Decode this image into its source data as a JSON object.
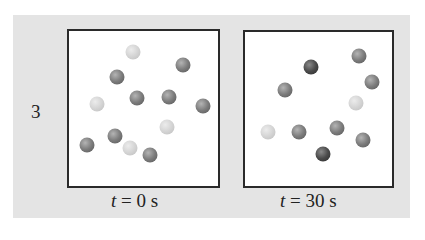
{
  "row": {
    "label": "3"
  },
  "colors": {
    "panel_bg": "#e4e4e4",
    "box_bg": "#ffffff",
    "box_border": "#2a2a2a",
    "ball_light": "#d2d2d2",
    "ball_medium": "#7c7c7c",
    "ball_dark": "#4a4a4a"
  },
  "frames": [
    {
      "variable": "t",
      "equals": " = 0 s",
      "balls": [
        {
          "type": "light",
          "x": 64,
          "y": 21
        },
        {
          "type": "medium",
          "x": 114,
          "y": 34
        },
        {
          "type": "medium",
          "x": 48,
          "y": 46
        },
        {
          "type": "medium",
          "x": 68,
          "y": 67
        },
        {
          "type": "medium",
          "x": 100,
          "y": 66
        },
        {
          "type": "medium",
          "x": 134,
          "y": 75
        },
        {
          "type": "light",
          "x": 28,
          "y": 73
        },
        {
          "type": "light",
          "x": 98,
          "y": 96
        },
        {
          "type": "medium",
          "x": 46,
          "y": 105
        },
        {
          "type": "medium",
          "x": 18,
          "y": 114
        },
        {
          "type": "light",
          "x": 61,
          "y": 117
        },
        {
          "type": "medium",
          "x": 81,
          "y": 124
        }
      ]
    },
    {
      "variable": "t",
      "equals": " = 30 s",
      "balls": [
        {
          "type": "medium",
          "x": 114,
          "y": 24
        },
        {
          "type": "dark",
          "x": 66,
          "y": 35
        },
        {
          "type": "medium",
          "x": 127,
          "y": 50
        },
        {
          "type": "medium",
          "x": 40,
          "y": 58
        },
        {
          "type": "light",
          "x": 111,
          "y": 71
        },
        {
          "type": "light",
          "x": 23,
          "y": 100
        },
        {
          "type": "medium",
          "x": 54,
          "y": 100
        },
        {
          "type": "medium",
          "x": 92,
          "y": 96
        },
        {
          "type": "medium",
          "x": 118,
          "y": 108
        },
        {
          "type": "dark",
          "x": 78,
          "y": 122
        }
      ]
    }
  ]
}
